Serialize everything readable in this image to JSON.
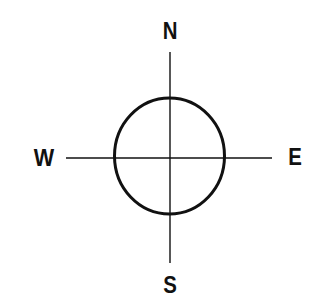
{
  "diagram": {
    "type": "compass-rose",
    "labels": {
      "north": "N",
      "south": "S",
      "west": "W",
      "east": "E"
    },
    "colors": {
      "stroke": "#111111",
      "background": "#ffffff"
    }
  }
}
